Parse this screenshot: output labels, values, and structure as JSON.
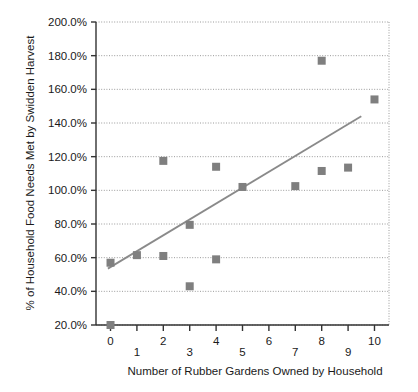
{
  "chart_data": {
    "type": "scatter",
    "title": "",
    "xlabel": "Number of Rubber Gardens Owned by Household",
    "ylabel": "% of Household Food Needs Met by Swidden Harvest",
    "xlim": [
      -0.55,
      10.55
    ],
    "ylim": [
      20,
      200
    ],
    "grid": true,
    "legend": null,
    "x_ticks": [
      0,
      1,
      2,
      3,
      4,
      5,
      6,
      7,
      8,
      9,
      10
    ],
    "x_tick_labels": [
      "0",
      "1",
      "2",
      "3",
      "4",
      "5",
      "6",
      "7",
      "8",
      "9",
      "10"
    ],
    "y_ticks": [
      20,
      40,
      60,
      80,
      100,
      120,
      140,
      160,
      180,
      200
    ],
    "y_tick_labels": [
      "20.0%",
      "40.0%",
      "60.0%",
      "80.0%",
      "100.0%",
      "120.0%",
      "140.0%",
      "160.0%",
      "180.0%",
      "200.0%"
    ],
    "marker": {
      "shape": "square",
      "color": "#7f7f7f",
      "size": 8
    },
    "points": [
      {
        "x": 0,
        "y": 20.0
      },
      {
        "x": 0,
        "y": 57.0
      },
      {
        "x": 1,
        "y": 61.5
      },
      {
        "x": 2,
        "y": 61.0
      },
      {
        "x": 2,
        "y": 117.5
      },
      {
        "x": 3,
        "y": 43.0
      },
      {
        "x": 3,
        "y": 79.5
      },
      {
        "x": 4,
        "y": 59.0
      },
      {
        "x": 4,
        "y": 114.0
      },
      {
        "x": 5,
        "y": 102.0
      },
      {
        "x": 7,
        "y": 102.5
      },
      {
        "x": 8,
        "y": 111.5
      },
      {
        "x": 8,
        "y": 177.0
      },
      {
        "x": 9,
        "y": 113.5
      },
      {
        "x": 10,
        "y": 154.0
      }
    ],
    "trendline": {
      "color": "#8a8a8a",
      "x_start": -0.1,
      "y_start": 53.5,
      "x_end": 9.5,
      "y_end": 144.0
    },
    "colors": {
      "marker": "#7f7f7f",
      "trendline": "#8a8a8a",
      "gridline": "#9a9a9a",
      "axis": "#333333",
      "text": "#1a1a1a",
      "background": "#ffffff"
    }
  }
}
